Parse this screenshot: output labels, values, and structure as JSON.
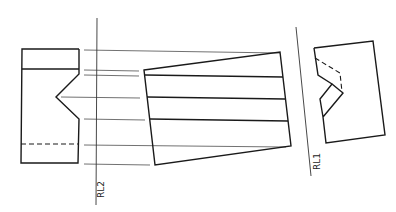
{
  "diagram": {
    "type": "auxiliary projection drawing",
    "reference_lines": [
      {
        "id": "rl2",
        "label": "RL2"
      },
      {
        "id": "rl1",
        "label": "RL1"
      }
    ],
    "views": [
      {
        "id": "left-view",
        "description": "block with V-notch on right side, top face line and hidden dashed line near bottom"
      },
      {
        "id": "middle-view",
        "description": "tilted quadrilateral with three horizontal edge lines"
      },
      {
        "id": "right-view",
        "description": "tilted block with V-notch on left side, hidden dashed lines"
      }
    ],
    "colors": {
      "line": "#1a1a1a",
      "background": "#ffffff"
    }
  }
}
